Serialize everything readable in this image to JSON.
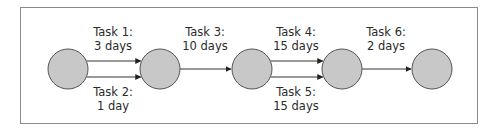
{
  "diagram": {
    "colors": {
      "node_fill": "#c8c8c8",
      "node_stroke": "#555555",
      "edge": "#333333",
      "frame": "#8a8a8a",
      "text": "#2a2a2a"
    },
    "nodes": [
      {
        "id": "n1",
        "cx": 68,
        "cy": 69,
        "r": 20
      },
      {
        "id": "n2",
        "cx": 160,
        "cy": 69,
        "r": 20
      },
      {
        "id": "n3",
        "cx": 252,
        "cy": 69,
        "r": 20
      },
      {
        "id": "n4",
        "cx": 342,
        "cy": 69,
        "r": 20
      },
      {
        "id": "n5",
        "cx": 432,
        "cy": 69,
        "r": 20
      }
    ],
    "tasks": [
      {
        "name": "Task 1:",
        "duration": "3 days",
        "from": "n1",
        "to": "n2",
        "y": 61,
        "label_pos": "above",
        "label_x": 113,
        "label_y": 25
      },
      {
        "name": "Task 2:",
        "duration": "1 day",
        "from": "n1",
        "to": "n2",
        "y": 77,
        "label_pos": "below",
        "label_x": 113,
        "label_y": 85
      },
      {
        "name": "Task 3:",
        "duration": "10 days",
        "from": "n2",
        "to": "n3",
        "y": 69,
        "label_pos": "above",
        "label_x": 205,
        "label_y": 25
      },
      {
        "name": "Task 4:",
        "duration": "15 days",
        "from": "n3",
        "to": "n4",
        "y": 61,
        "label_pos": "above",
        "label_x": 296,
        "label_y": 25
      },
      {
        "name": "Task 5:",
        "duration": "15 days",
        "from": "n3",
        "to": "n4",
        "y": 77,
        "label_pos": "below",
        "label_x": 296,
        "label_y": 85
      },
      {
        "name": "Task 6:",
        "duration": "2 days",
        "from": "n4",
        "to": "n5",
        "y": 69,
        "label_pos": "above",
        "label_x": 386,
        "label_y": 25
      }
    ]
  }
}
